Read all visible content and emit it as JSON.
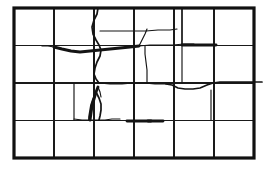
{
  "figure": {
    "background_color": "#ffffff",
    "border_color": "#111111",
    "grid_color": "#1a1a1a",
    "crack_color": "#141414"
  },
  "panel": {
    "x": 14,
    "y": 8,
    "width": 240,
    "height": 150,
    "columns": 6,
    "rows": 4,
    "column_width": 40,
    "row_height": 37.5,
    "border_stroke_width": 3.2,
    "grid_stroke_width": 1.1
  },
  "grid": {
    "vertical_x": [
      54,
      94,
      134,
      174,
      214
    ],
    "horizontal_y": [
      45.5,
      83,
      120.5
    ]
  },
  "chart_data": {
    "type": "diagram",
    "xlabel": "",
    "ylabel": "",
    "xlim": [
      14,
      254
    ],
    "ylim": [
      8,
      158
    ],
    "grid": true,
    "legend": "none",
    "cracks": [
      {
        "id": "crack-top-curve",
        "label": "upper-middle descending curve",
        "weight": "medium",
        "points": "98,8 97,14 94,20 92,27 93,34 96,40 99,45 101,50 100,56 97,62 95,68 94,74 96,79 99,83"
      },
      {
        "id": "crack-top-branch-right",
        "label": "branch from top curve to right",
        "weight": "thin",
        "points": "100,31 109,31 120,31 133,31 146,31 158,30 170,30 177,29"
      },
      {
        "id": "crack-main-horizontal",
        "label": "main horizontal crack across mid-upper panel",
        "weight": "thick",
        "points": "54,47 62,49 71,51 80,52 90,51 100,50 110,49 120,48 130,47 139,46"
      },
      {
        "id": "crack-horizontal-left-tail",
        "label": "left tail of main horizontal crack",
        "weight": "thin",
        "points": "54,47 48,46 42,46"
      },
      {
        "id": "crack-horizontal-right-ext",
        "label": "right extension of main horizontal crack",
        "weight": "thin",
        "points": "139,46 150,45 162,45 173,45 184,44 194,44"
      },
      {
        "id": "crack-v-branch-up",
        "label": "short upward branch near x=145",
        "weight": "thin",
        "points": "139,46 142,40 145,34 147,29"
      },
      {
        "id": "crack-vertical-mid",
        "label": "vertical crack descending from horizontal crack",
        "weight": "thin",
        "points": "145,46 145,54 146,62 147,70 147,78 147,83"
      },
      {
        "id": "crack-vertical-left-mid",
        "label": "short vertical crack at left of middle row",
        "weight": "thin",
        "points": "94,52 94,60 94,68 94,76 94,83"
      },
      {
        "id": "crack-mid-diagonal",
        "label": "diagonal crack middle band toward right",
        "weight": "thin",
        "points": "99,83 110,84 122,84 133,83 144,83 155,84 166,84"
      },
      {
        "id": "crack-right-step",
        "label": "stepped crack right of centre",
        "weight": "medium",
        "points": "166,84 172,85 178,88 185,89 193,89 200,88 207,85 213,83 220,82 228,82 236,82 245,82 254,82 262,82"
      },
      {
        "id": "crack-right-upper-vert",
        "label": "vertical crack upper right column",
        "weight": "medium",
        "points": "182,8 182,16 182,24 182,32 182,40 182,45"
      },
      {
        "id": "crack-right-thick-horizontal",
        "label": "thick short horizontal crack upper right",
        "weight": "thick",
        "points": "182,45 191,45 200,45 209,45 216,45"
      },
      {
        "id": "crack-right-vert-lower",
        "label": "vertical crack descending at right of middle rows",
        "weight": "thin",
        "points": "182,46 182,54 182,62 182,70 182,78 182,83"
      },
      {
        "id": "crack-right-mid-vert2",
        "label": "vertical crack right band below step",
        "weight": "thin",
        "points": "211,90 211,98 211,106 211,114 211,120"
      },
      {
        "id": "crack-y-fork-stem",
        "label": "Y-shaped fork crack stem lower left-middle",
        "weight": "thick",
        "points": "90,120 91,113 92,106 94,99 96,92 98,87"
      },
      {
        "id": "crack-y-fork-left",
        "label": "Y-shaped fork left prong",
        "weight": "medium",
        "points": "96,92 93,99 91,105 90,111 89,117 89,120"
      },
      {
        "id": "crack-y-fork-right",
        "label": "Y-shaped fork right prong",
        "weight": "medium",
        "points": "96,92 99,98 101,104 101,110 100,116 99,120"
      },
      {
        "id": "crack-y-fork-top",
        "label": "Y-shaped fork upper tip",
        "weight": "thin",
        "points": "98,87 100,92 101,97"
      },
      {
        "id": "crack-lower-horizontal-left",
        "label": "horizontal crack lower-left band",
        "weight": "thin",
        "points": "74,119 82,120 89,120 97,120 105,120 112,119 120,119"
      },
      {
        "id": "crack-lower-horizontal-thick",
        "label": "thick horizontal crack above bottom row",
        "weight": "thick",
        "points": "127,121 135,121 143,121 151,121"
      },
      {
        "id": "crack-lower-left-vert",
        "label": "vertical crack at x=74 lower band",
        "weight": "thin",
        "points": "74,84 74,92 74,100 74,108 74,116 74,120"
      },
      {
        "id": "crack-mid-right-vert",
        "label": "vertical crack near x=134 lower band",
        "weight": "thin",
        "points": "134,84 134,92 134,100 134,108 134,115 134,120"
      },
      {
        "id": "crack-bottom-left-thick",
        "label": "thick short crack left of lower band",
        "weight": "thick",
        "points": "148,121 156,121 163,121"
      }
    ]
  },
  "caption": {
    "text": ""
  }
}
